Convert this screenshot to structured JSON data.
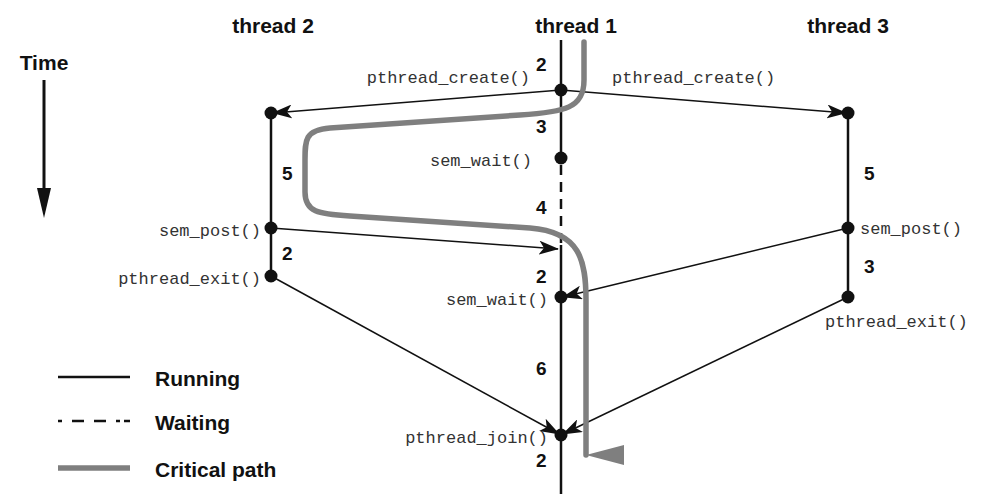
{
  "colors": {
    "ink": "#111111",
    "critical_path": "#7f7f7f",
    "code_text": "#333333",
    "background": "#ffffff"
  },
  "time_axis": {
    "label": "Time",
    "direction": "down"
  },
  "threads": [
    {
      "id": "thread2",
      "label": "thread 2",
      "segments": [
        {
          "duration": "5",
          "state": "running"
        },
        {
          "duration": "2",
          "state": "running"
        }
      ],
      "events": [
        "created",
        "sem_post()",
        "pthread_exit()"
      ]
    },
    {
      "id": "thread1",
      "label": "thread 1",
      "segments": [
        {
          "duration": "2",
          "state": "running"
        },
        {
          "duration": "3",
          "state": "running"
        },
        {
          "duration": "4",
          "state": "waiting"
        },
        {
          "duration": "2",
          "state": "running"
        },
        {
          "duration": "6",
          "state": "running"
        },
        {
          "duration": "2",
          "state": "running"
        }
      ],
      "events": [
        "pthread_create()",
        "sem_wait()",
        "sem_wait()",
        "pthread_join()"
      ]
    },
    {
      "id": "thread3",
      "label": "thread 3",
      "segments": [
        {
          "duration": "5",
          "state": "running"
        },
        {
          "duration": "3",
          "state": "running"
        }
      ],
      "events": [
        "created",
        "sem_post()",
        "pthread_exit()"
      ]
    }
  ],
  "labels": {
    "t1_create_left": "pthread_create()",
    "t1_create_right": "pthread_create()",
    "t1_sem_wait_1": "sem_wait()",
    "t1_sem_wait_2": "sem_wait()",
    "t1_join": "pthread_join()",
    "t2_sem_post": "sem_post()",
    "t2_exit": "pthread_exit()",
    "t3_sem_post": "sem_post()",
    "t3_exit": "pthread_exit()",
    "t1_seg_1": "2",
    "t1_seg_2": "3",
    "t1_seg_3": "4",
    "t1_seg_4": "2",
    "t1_seg_5": "6",
    "t1_seg_6": "2",
    "t2_seg_1": "5",
    "t2_seg_2": "2",
    "t3_seg_1": "5",
    "t3_seg_2": "3"
  },
  "legend": {
    "items": [
      {
        "style": "solid",
        "label": "Running"
      },
      {
        "style": "dashed",
        "label": "Waiting"
      },
      {
        "style": "critical",
        "label": "Critical path"
      }
    ]
  }
}
